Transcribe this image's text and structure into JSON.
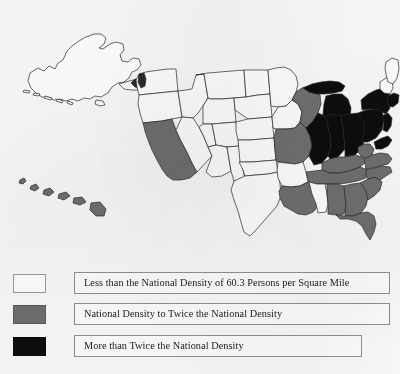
{
  "document": {
    "type": "choropleth-map",
    "subject": "United States population density by state"
  },
  "map": {
    "title": "",
    "insets": [
      "alaska",
      "hawaii"
    ],
    "colors": {
      "low": "#fdfdfd",
      "mid": "#6f6f6f",
      "high": "#0d0d0d",
      "outline": "#2a2a2a",
      "background": "#f8f8f7"
    },
    "classes": {
      "low": "Less than the National Density of 60.3 Persons per Square Mile",
      "mid": "National Density to Twice the National Density",
      "high": "More than Twice the National Density"
    },
    "states": [
      {
        "code": "AK",
        "name": "Alaska",
        "class": "low"
      },
      {
        "code": "HI",
        "name": "Hawaii",
        "class": "mid"
      },
      {
        "code": "WA",
        "name": "Washington",
        "class": "low"
      },
      {
        "code": "OR",
        "name": "Oregon",
        "class": "low"
      },
      {
        "code": "CA",
        "name": "California",
        "class": "mid"
      },
      {
        "code": "ID",
        "name": "Idaho",
        "class": "low"
      },
      {
        "code": "NV",
        "name": "Nevada",
        "class": "low"
      },
      {
        "code": "MT",
        "name": "Montana",
        "class": "low"
      },
      {
        "code": "WY",
        "name": "Wyoming",
        "class": "low"
      },
      {
        "code": "UT",
        "name": "Utah",
        "class": "low"
      },
      {
        "code": "AZ",
        "name": "Arizona",
        "class": "low"
      },
      {
        "code": "CO",
        "name": "Colorado",
        "class": "low"
      },
      {
        "code": "NM",
        "name": "New Mexico",
        "class": "low"
      },
      {
        "code": "ND",
        "name": "North Dakota",
        "class": "low"
      },
      {
        "code": "SD",
        "name": "South Dakota",
        "class": "low"
      },
      {
        "code": "NE",
        "name": "Nebraska",
        "class": "low"
      },
      {
        "code": "KS",
        "name": "Kansas",
        "class": "low"
      },
      {
        "code": "OK",
        "name": "Oklahoma",
        "class": "low"
      },
      {
        "code": "TX",
        "name": "Texas",
        "class": "low"
      },
      {
        "code": "MN",
        "name": "Minnesota",
        "class": "low"
      },
      {
        "code": "IA",
        "name": "Iowa",
        "class": "low"
      },
      {
        "code": "MO",
        "name": "Missouri",
        "class": "mid"
      },
      {
        "code": "AR",
        "name": "Arkansas",
        "class": "low"
      },
      {
        "code": "LA",
        "name": "Louisiana",
        "class": "mid"
      },
      {
        "code": "WI",
        "name": "Wisconsin",
        "class": "mid"
      },
      {
        "code": "IL",
        "name": "Illinois",
        "class": "high"
      },
      {
        "code": "MI",
        "name": "Michigan",
        "class": "high"
      },
      {
        "code": "IN",
        "name": "Indiana",
        "class": "high"
      },
      {
        "code": "OH",
        "name": "Ohio",
        "class": "high"
      },
      {
        "code": "KY",
        "name": "Kentucky",
        "class": "mid"
      },
      {
        "code": "TN",
        "name": "Tennessee",
        "class": "mid"
      },
      {
        "code": "MS",
        "name": "Mississippi",
        "class": "low"
      },
      {
        "code": "AL",
        "name": "Alabama",
        "class": "mid"
      },
      {
        "code": "GA",
        "name": "Georgia",
        "class": "mid"
      },
      {
        "code": "FL",
        "name": "Florida",
        "class": "mid"
      },
      {
        "code": "SC",
        "name": "South Carolina",
        "class": "mid"
      },
      {
        "code": "NC",
        "name": "North Carolina",
        "class": "mid"
      },
      {
        "code": "VA",
        "name": "Virginia",
        "class": "mid"
      },
      {
        "code": "WV",
        "name": "West Virginia",
        "class": "mid"
      },
      {
        "code": "PA",
        "name": "Pennsylvania",
        "class": "high"
      },
      {
        "code": "NY",
        "name": "New York",
        "class": "high"
      },
      {
        "code": "MD",
        "name": "Maryland",
        "class": "high"
      },
      {
        "code": "DE",
        "name": "Delaware",
        "class": "high"
      },
      {
        "code": "NJ",
        "name": "New Jersey",
        "class": "high"
      },
      {
        "code": "CT",
        "name": "Connecticut",
        "class": "high"
      },
      {
        "code": "RI",
        "name": "Rhode Island",
        "class": "high"
      },
      {
        "code": "MA",
        "name": "Massachusetts",
        "class": "high"
      },
      {
        "code": "VT",
        "name": "Vermont",
        "class": "low"
      },
      {
        "code": "NH",
        "name": "New Hampshire",
        "class": "low"
      },
      {
        "code": "ME",
        "name": "Maine",
        "class": "low"
      }
    ]
  },
  "legend": {
    "items": [
      {
        "swatch": "low",
        "label": "Less than the National Density of 60.3 Persons per Square Mile"
      },
      {
        "swatch": "mid",
        "label": "National Density to Twice the National Density"
      },
      {
        "swatch": "high",
        "label": "More than Twice the National Density"
      }
    ]
  }
}
